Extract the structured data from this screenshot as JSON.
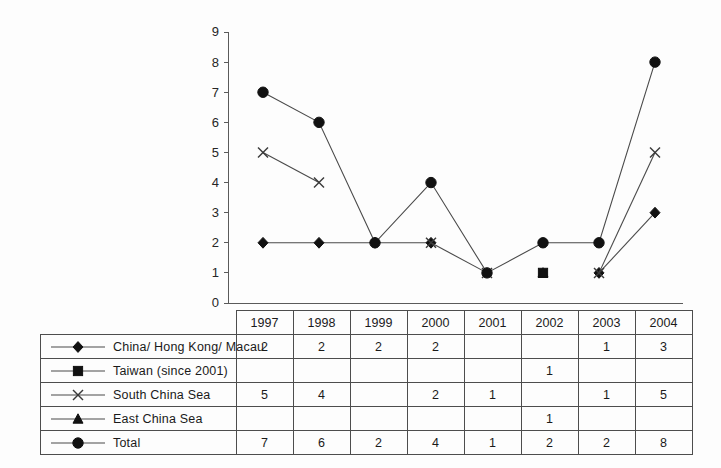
{
  "chart_data": {
    "type": "line",
    "title": "",
    "subtitle": "",
    "xlabel": "",
    "ylabel": "",
    "categories": [
      "1997",
      "1998",
      "1999",
      "2000",
      "2001",
      "2002",
      "2003",
      "2004"
    ],
    "ylim": [
      0,
      9
    ],
    "ytick_labels": [
      "0",
      "1",
      "2",
      "3",
      "4",
      "5",
      "6",
      "7",
      "8",
      "9"
    ],
    "grid": false,
    "legend_position": "table-left-column",
    "series": [
      {
        "name": "China/ Hong Kong/ Macau",
        "marker": "diamond",
        "values": [
          2,
          2,
          2,
          2,
          null,
          null,
          1,
          3
        ],
        "cells": [
          "2",
          "2",
          "2",
          "2",
          "",
          "",
          "1",
          "3"
        ]
      },
      {
        "name": "Taiwan (since 2001)",
        "marker": "square",
        "values": [
          null,
          null,
          null,
          null,
          null,
          1,
          null,
          null
        ],
        "cells": [
          "",
          "",
          "",
          "",
          "",
          "1",
          "",
          ""
        ]
      },
      {
        "name": "South China Sea",
        "marker": "x",
        "values": [
          5,
          4,
          null,
          2,
          1,
          null,
          1,
          5
        ],
        "cells": [
          "5",
          "4",
          "",
          "2",
          "1",
          "",
          "1",
          "5"
        ]
      },
      {
        "name": "East  China Sea",
        "marker": "triangle",
        "values": [
          null,
          null,
          null,
          null,
          null,
          1,
          null,
          null
        ],
        "cells": [
          "",
          "",
          "",
          "",
          "",
          "1",
          "",
          ""
        ]
      },
      {
        "name": "Total",
        "marker": "circle",
        "values": [
          7,
          6,
          2,
          4,
          1,
          2,
          2,
          8
        ],
        "cells": [
          "7",
          "6",
          "2",
          "4",
          "1",
          "2",
          "2",
          "8"
        ]
      }
    ]
  },
  "colors": {
    "background": "#fdfdfd",
    "axis": "#5a5a5a",
    "line": "#4a4a4a",
    "marker": "#111111",
    "border": "#4d4d4d",
    "text": "#1a1a1a"
  }
}
